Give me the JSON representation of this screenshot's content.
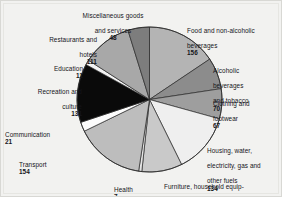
{
  "figure": {
    "background_color": "#f2f2f0",
    "frame_color": "#d8d8d4"
  },
  "chart_data": {
    "type": "pie",
    "title": "",
    "subtitle": "",
    "xlabel": "",
    "ylabel": "",
    "total": 1000,
    "units": "index points",
    "legend_position": "none",
    "labels_placement": "outside-callout",
    "start_angle_deg": -90,
    "direction": "clockwise",
    "categories": [
      "Food and non-alcoholic beverages",
      "Alcoholic beverages and tobacco",
      "Clothing and footwear",
      "Housing, water, electricity, gas and other fuels",
      "Furniture, household equipment and maintenance",
      "Health",
      "Transport",
      "Communication",
      "Recreation and culture",
      "Education",
      "Restaurants and hotels",
      "Miscellaneous goods and services"
    ],
    "values": [
      156,
      70,
      67,
      134,
      90,
      7,
      154,
      21,
      131,
      11,
      111,
      48
    ],
    "colors": [
      "#b4b4b4",
      "#8c8c8c",
      "#9e9e9e",
      "#efefef",
      "#c9c9c9",
      "#e4e4e4",
      "#bdbdbd",
      "#fcfcfc",
      "#0a0a0a",
      "#f4f4f4",
      "#a8a8a8",
      "#7d7d7d"
    ],
    "slice_border_color": "#2a2a2a",
    "slices": [
      {
        "name": "Food and non-alcoholic beverages",
        "value": 156,
        "color": "#b4b4b4"
      },
      {
        "name": "Alcoholic beverages and tobacco",
        "value": 70,
        "color": "#8c8c8c"
      },
      {
        "name": "Clothing and footwear",
        "value": 67,
        "color": "#9e9e9e"
      },
      {
        "name": "Housing, water, electricity, gas and other fuels",
        "value": 134,
        "color": "#efefef"
      },
      {
        "name": "Furniture, household equipment and maintenance",
        "value": 90,
        "color": "#c9c9c9"
      },
      {
        "name": "Health",
        "value": 7,
        "color": "#e4e4e4"
      },
      {
        "name": "Transport",
        "value": 154,
        "color": "#bdbdbd"
      },
      {
        "name": "Communication",
        "value": 21,
        "color": "#fcfcfc"
      },
      {
        "name": "Recreation and culture",
        "value": 131,
        "color": "#0a0a0a"
      },
      {
        "name": "Education",
        "value": 11,
        "color": "#f4f4f4"
      },
      {
        "name": "Restaurants and hotels",
        "value": 111,
        "color": "#a8a8a8"
      },
      {
        "name": "Miscellaneous goods and services",
        "value": 48,
        "color": "#7d7d7d"
      }
    ]
  },
  "labels": {
    "misc_goods": {
      "line1": "Miscellaneous goods",
      "line2": "and services",
      "value": "48"
    },
    "food": {
      "line1": "Food and non-alcoholic",
      "line2": "beverages",
      "value": "156"
    },
    "alcohol": {
      "line1": "Alcoholic",
      "line2": "beverages",
      "line3": "and tobacco",
      "value": "70"
    },
    "clothing": {
      "line1": "Clothing and",
      "line2": "footwear",
      "value": "67"
    },
    "housing": {
      "line1": "Housing, water,",
      "line2": "electricity, gas and",
      "line3": "other fuels",
      "value": "134"
    },
    "furniture": {
      "line1": "Furniture, household equip-",
      "line2": "ment and maintenance",
      "value": "90"
    },
    "health": {
      "line1": "Health",
      "value": "7"
    },
    "transport": {
      "line1": "Transport",
      "value": "154"
    },
    "communication": {
      "line1": "Communication",
      "value": "21"
    },
    "recreation": {
      "line1": "Recreation and",
      "line2": "culture",
      "value": "131"
    },
    "education": {
      "line1": "Education",
      "value": "11"
    },
    "restaurants": {
      "line1": "Restaurants and",
      "line2": "hotels",
      "value": "111"
    }
  }
}
